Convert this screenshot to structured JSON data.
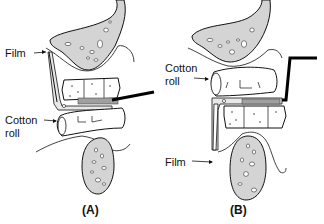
{
  "panels": [
    {
      "id": "A",
      "caption": "(A)",
      "labels": {
        "film": "Film",
        "cotton_roll_line1": "Cotton",
        "cotton_roll_line2": "roll"
      }
    },
    {
      "id": "B",
      "caption": "(B)",
      "labels": {
        "cotton_roll_line1": "Cotton",
        "cotton_roll_line2": "roll",
        "film": "Film"
      }
    }
  ],
  "colors": {
    "bone_fill": "#d4d4d4",
    "outline": "#111111",
    "indicator_rod": "#000000",
    "background": "#ffffff"
  }
}
